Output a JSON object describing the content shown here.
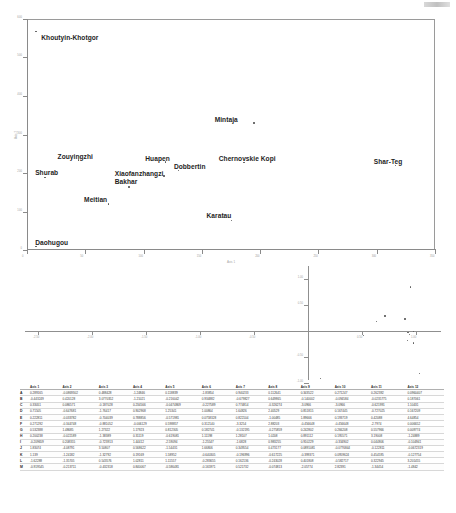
{
  "document": {
    "corner_mark": "scan-artifact"
  },
  "figure_top": {
    "name": "locality-ordination-scatter",
    "xlabel": "Axis 1",
    "ylabel": "Axis 2",
    "yticks": [
      "600",
      "500",
      "400",
      "300",
      "200",
      "100",
      "0"
    ],
    "xticks": [
      "0",
      "50",
      "100",
      "150",
      "200",
      "250",
      "300",
      "350"
    ],
    "points": [
      {
        "label": "Khoutyin-Khotgor",
        "x": 2.0,
        "y": 95.0,
        "lx": 3.5,
        "ly": 93.6
      },
      {
        "label": "Mintaja",
        "x": 55.5,
        "y": 55.2,
        "lx": 46.0,
        "ly": 57.8
      },
      {
        "label": "Zouyingzhi",
        "x": 12.5,
        "y": 39.2,
        "lx": 7.5,
        "ly": 42.0
      },
      {
        "label": "Huapen",
        "x": 33.8,
        "y": 38.4,
        "lx": 29.0,
        "ly": 41.2
      },
      {
        "label": "Chernovskie Kopi",
        "x": 53.0,
        "y": 38.2,
        "lx": 47.0,
        "ly": 41.0
      },
      {
        "label": "Shar-Teg",
        "x": 90.2,
        "y": 36.8,
        "lx": 85.0,
        "ly": 40.0
      },
      {
        "label": "Dobbertin",
        "x": 37.0,
        "y": 34.8,
        "lx": 36.0,
        "ly": 37.8
      },
      {
        "label": "Shurab",
        "x": 4.2,
        "y": 31.8,
        "lx": 2.0,
        "ly": 35.2
      },
      {
        "label": "Xiaofanzhangzi",
        "x": 33.4,
        "y": 32.4,
        "lx": 21.5,
        "ly": 34.6
      },
      {
        "label": "Bakhar",
        "x": 24.8,
        "y": 27.6,
        "lx": 21.5,
        "ly": 31.0
      },
      {
        "label": "Meitian",
        "x": 19.8,
        "y": 20.2,
        "lx": 14.0,
        "ly": 23.2
      },
      {
        "label": "Karatau",
        "x": 50.0,
        "y": 13.0,
        "lx": 44.0,
        "ly": 16.5
      },
      {
        "label": "Daohugou",
        "x": 2.0,
        "y": 1.8,
        "lx": 2.0,
        "ly": 4.6
      }
    ]
  },
  "figure_middle": {
    "name": "axis-loadings-plot",
    "yticks": [
      "1.00",
      "0.50",
      "-0.50",
      "-1.00"
    ],
    "xticks": [
      "-2.50",
      "-2.00",
      "-1.50",
      "-1.00",
      "-0.50",
      "0.50",
      "1.00"
    ],
    "points": [
      {
        "x": 0.955,
        "y": 0.88
      },
      {
        "x": 0.72,
        "y": 0.32
      },
      {
        "x": 0.905,
        "y": 0.26
      },
      {
        "x": 0.645,
        "y": 0.22
      },
      {
        "x": 0.985,
        "y": 0.02
      },
      {
        "x": 0.935,
        "y": 0.0
      },
      {
        "x": 0.945,
        "y": -0.03
      },
      {
        "x": 0.52,
        "y": -0.05
      },
      {
        "x": 0.93,
        "y": -0.15
      },
      {
        "x": 0.985,
        "y": -0.2
      },
      {
        "x": 1.04,
        "y": -0.78
      },
      {
        "x": 0.125,
        "y": -0.88
      }
    ]
  },
  "table": {
    "name": "axis-coordinates-table",
    "row_label_header": "",
    "columns": [
      "Axis 1",
      "Axis 2",
      "Axis 3",
      "Axis 4",
      "Axis 5",
      "Axis 6",
      "Axis 7",
      "Axis 8",
      "Axis 9",
      "Axis 10",
      "Axis 11",
      "Axis 12"
    ],
    "rows": [
      {
        "label": "A",
        "values": [
          "0.289165",
          "-0.0869302",
          "0.488428",
          "-1.24846",
          "0.118839",
          "-1.83854",
          "0.940233",
          "0.112641",
          "0.343522",
          "0.271247",
          "0.262392",
          "0.0960407"
        ]
      },
      {
        "label": "B",
        "values": [
          "-0.443249",
          "0.420128",
          "3.0770352",
          "-1.21021",
          "-0.216042",
          "0.934882",
          "-0.679827",
          "0.649865",
          "-0.140002",
          "-0.094584",
          "-0.0235775",
          "0.187061"
        ]
      },
      {
        "label": "C",
        "values": [
          "0.33051",
          "0.086571",
          "-0.187028",
          "0.234566",
          "-0.0474869",
          "-0.227589",
          "0.774814",
          "-0.326274",
          "-3.0966",
          "-3.0966",
          "-0.621991",
          "1.10431"
        ]
      },
      {
        "label": "D",
        "values": [
          "0.71505",
          "-0.647681",
          "-1.76417",
          "0.902968",
          "1.25341",
          "1.00864",
          "1.64826",
          "2.40529",
          "0.851815",
          "0.167445",
          "-0.727025",
          "0.167209"
        ]
      },
      {
        "label": "E",
        "values": [
          "0.222811",
          "-0.033782",
          "-0.704039",
          "0.788856",
          "-0.571981",
          "0.0758328",
          "0.822104",
          "-1.00485",
          "1.89666",
          "0.193719",
          "0.42088",
          "4.64854"
        ]
      },
      {
        "label": "F",
        "values": [
          "0.271292",
          "-0.344748",
          "-0.881052",
          "-0.006129",
          "0.598857",
          "0.312140",
          "-3.3254",
          "2.88203",
          "-0.456648",
          "-0.456648",
          "-2.7974",
          "0.006652"
        ]
      },
      {
        "label": "G",
        "values": [
          "0.532388",
          "1.48685",
          "1.27322",
          "1.17923",
          "0.812305",
          "0.182741",
          "-0.132195",
          "-0.275859",
          "0.242802",
          "0.266208",
          "0.557966",
          "0.009774"
        ]
      },
      {
        "label": "H",
        "values": [
          "0.200238",
          "-0.022189",
          "-1.38389",
          "0.31119",
          "-0.619081",
          "1.11198",
          "1.28107",
          "1.0208",
          "0.891112",
          "0.195571",
          "3.19008",
          "-1.24889"
        ]
      },
      {
        "label": "I",
        "values": [
          "-0.209659",
          "0.208355",
          "-0.723913",
          "1.44412",
          "-2.59094",
          "-1.25547",
          "-1.6828",
          "0.983255",
          "0.910229",
          "-0.334902",
          "0.044806",
          "-0.104941"
        ]
      },
      {
        "label": "J",
        "values": [
          "1.83074",
          "-4.08791",
          "3.50807",
          "0.568622",
          "-1.54431",
          "1.66806",
          "0.349554",
          "0.473177",
          "0.0891081",
          "-0.0776844",
          "-0.122811",
          "-0.0672319"
        ]
      },
      {
        "label": "K",
        "values": [
          "1.139",
          "-1.24182",
          "-1.32792",
          "0.19169",
          "1.58952",
          "-0.640305",
          "-0.196996",
          "-0.617225",
          "-0.399371",
          "0.0959624",
          "0.454595",
          "-0.127754"
        ]
      },
      {
        "label": "L",
        "values": [
          "-1.62288",
          "-1.35705",
          "0.543576",
          "1.02811",
          "1.11557",
          "-0.283655",
          "0.162136",
          "-0.243028",
          "0.401808",
          "-0.582717",
          "0.322945",
          "3.201455"
        ]
      },
      {
        "label": "M",
        "values": [
          "-0.919545",
          "-0.213711",
          "-0.432318",
          "0.840067",
          "-0.586481",
          "-0.165971",
          "0.521732",
          "-0.074813",
          "-2.05774",
          "2.82391",
          "-1.34454",
          "-1.4842"
        ]
      }
    ]
  }
}
